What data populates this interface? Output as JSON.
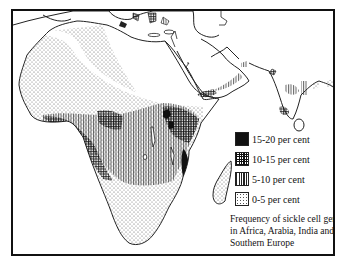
{
  "figure": {
    "title": "Frequency of sickle cell gene in Africa, Arabia, India and Southern Europe",
    "caption_lines": [
      "Frequency of sickle cell gene",
      "in Africa, Arabia, India and",
      "Southern Europe"
    ]
  },
  "legend": {
    "items": [
      {
        "label": "15-20 per cent",
        "pattern": "solid-black"
      },
      {
        "label": "10-15 per cent",
        "pattern": "crosshatch"
      },
      {
        "label": "5-10 per cent",
        "pattern": "vertical-lines"
      },
      {
        "label": "0-5 per cent",
        "pattern": "stipple"
      }
    ]
  },
  "map": {
    "regions_shown": [
      "Africa",
      "Arabia",
      "India",
      "Southern Europe",
      "Madagascar",
      "Sri Lanka"
    ],
    "style": "monochrome"
  }
}
